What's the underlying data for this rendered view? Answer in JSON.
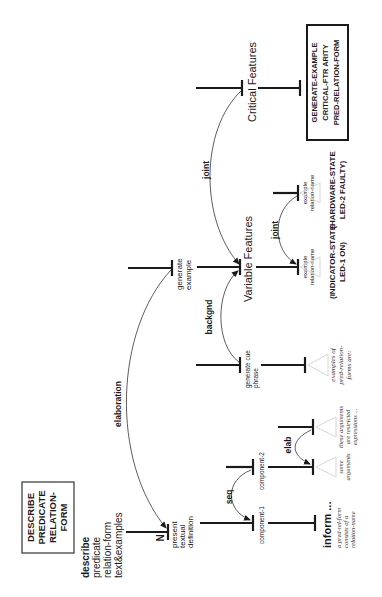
{
  "goal_box": {
    "lines": [
      "DESCRIBE",
      "PREDICATE",
      "RELATION-",
      "FORM"
    ]
  },
  "root": {
    "lines": [
      "describe",
      "predicate",
      "relation-form",
      "text&examples"
    ]
  },
  "present": {
    "nucleus_mark": "N",
    "lines": [
      "present",
      "textual",
      "definition"
    ]
  },
  "generate_example": {
    "lines": [
      "generate",
      "example"
    ]
  },
  "relations": {
    "elaboration": "elaboration",
    "seq": "seq",
    "elab": "elab",
    "backgnd": "backgnd",
    "joint_critical": "joint",
    "joint_examples": "joint"
  },
  "component_1": "component-1",
  "component_2": "component-2",
  "inform": {
    "label": "inform ...",
    "text_lines": [
      "a pred-rel-form",
      "consists of a",
      "relation-name"
    ]
  },
  "some_arguments": {
    "lines": [
      "some",
      "arguments"
    ]
  },
  "these_arguments": {
    "lines": [
      "these arguments",
      "are restricted",
      "expressions ..."
    ]
  },
  "generate_cue_phrase": {
    "lines": [
      "generate cue",
      "phrase"
    ]
  },
  "cue_examples": {
    "lines": [
      "examples of",
      "pred-relation-",
      "forms are:"
    ]
  },
  "variable_features": "Variable Features",
  "critical_features": "Critical Features",
  "example_1": {
    "lines": [
      "example",
      "relation-name"
    ],
    "value_lines": [
      "(INDICATOR-STATE",
      "LED-1 ON)"
    ]
  },
  "example_2": {
    "lines": [
      "example",
      "relation-name"
    ],
    "value_lines": [
      "(HARDWARE-STATE",
      "LED-2 FAULTY)"
    ]
  },
  "critical_box": {
    "lines": [
      "GENERATE-EXAMPLE",
      "CRITICAL-FTR ARITY",
      "PRED-RELATION-FORM"
    ]
  }
}
